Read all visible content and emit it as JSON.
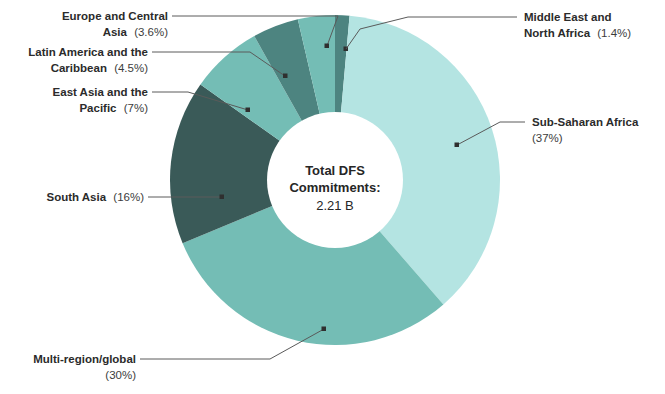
{
  "chart_data": {
    "type": "pie",
    "variant": "donut",
    "title": "",
    "subtitle": "",
    "xlabel": "",
    "ylabel": "",
    "legend_position": "none",
    "grid": false,
    "center_label": {
      "line1": "Total DFS",
      "line2": "Commitments:",
      "value": "2.21 B"
    },
    "categories": [
      "Middle East and North Africa",
      "Sub-Saharan Africa",
      "Multi-region/global",
      "South Asia",
      "East Asia and the Pacific",
      "Latin America and the Caribbean",
      "Europe and Central Asia"
    ],
    "values": [
      1.4,
      37,
      30,
      16,
      7,
      4.5,
      3.6
    ],
    "value_labels": [
      "(1.4%)",
      "(37%)",
      "(30%)",
      "(16%)",
      "(7%)",
      "(4.5%)",
      "(3.6%)"
    ],
    "colors": [
      "#4d8480",
      "#b4e4e2",
      "#74bdb5",
      "#3a5a58",
      "#74bdb5",
      "#4d8480",
      "#74bdb5"
    ],
    "units": "percent",
    "total": "2.21 B"
  },
  "slices": [
    {
      "name": "Middle East and North Africa",
      "label": "Middle East and North Africa",
      "label_line1": "Middle East and",
      "label_line2": "North Africa",
      "pct_text": "(1.4%)",
      "value": 1.4,
      "color": "#4d8480"
    },
    {
      "name": "Sub-Saharan Africa",
      "label": "Sub-Saharan Africa",
      "label_line1": "Sub-Saharan Africa",
      "label_line2": "",
      "pct_text": "(37%)",
      "value": 37,
      "color": "#b4e4e2"
    },
    {
      "name": "Multi-region/global",
      "label": "Multi-region/global",
      "label_line1": "Multi-region/global",
      "label_line2": "",
      "pct_text": "(30%)",
      "value": 30,
      "color": "#74bdb5"
    },
    {
      "name": "South Asia",
      "label": "South Asia",
      "label_line1": "South Asia",
      "label_line2": "",
      "pct_text": "(16%)",
      "value": 16,
      "color": "#3a5a58"
    },
    {
      "name": "East Asia and the Pacific",
      "label": "East Asia and the Pacific",
      "label_line1": "East Asia and the",
      "label_line2": "Pacific",
      "pct_text": "(7%)",
      "value": 7,
      "color": "#74bdb5"
    },
    {
      "name": "Latin America and the Caribbean",
      "label": "Latin America and the Caribbean",
      "label_line1": "Latin America and the",
      "label_line2": "Caribbean",
      "pct_text": "(4.5%)",
      "value": 4.5,
      "color": "#4d8480"
    },
    {
      "name": "Europe and Central Asia",
      "label": "Europe and Central Asia",
      "label_line1": "Europe and Central",
      "label_line2": "Asia",
      "pct_text": "(3.6%)",
      "value": 3.6,
      "color": "#74bdb5"
    }
  ],
  "palette": {
    "light_cyan": "#b4e4e2",
    "medium_teal": "#74bdb5",
    "dark_teal": "#4d8480",
    "dark_slate": "#3a5a58",
    "background": "#ffffff",
    "text": "#2b2b2b",
    "leader_line": "#5a5a5a"
  }
}
